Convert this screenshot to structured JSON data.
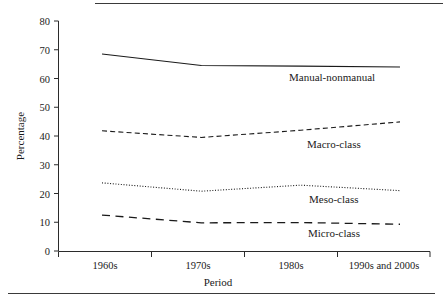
{
  "chart_data": {
    "type": "line",
    "title": "",
    "xlabel": "Period",
    "ylabel": "Percentage",
    "categories": [
      "1960s",
      "1970s",
      "1980s",
      "1990s and 2000s"
    ],
    "ylim": [
      0,
      80
    ],
    "yticks": [
      0,
      10,
      20,
      30,
      40,
      50,
      60,
      70,
      80
    ],
    "ytick_labels": [
      "0",
      "10",
      "20",
      "30",
      "40",
      "50",
      "60",
      "70",
      "80"
    ],
    "grid": false,
    "legend_position": "inline-right",
    "series": [
      {
        "name": "Manual-nonmanual",
        "values": [
          68.5,
          64.5,
          64.3,
          64.0
        ],
        "linestyle": "solid"
      },
      {
        "name": "Macro-class",
        "values": [
          41.8,
          39.5,
          42.0,
          44.9
        ],
        "linestyle": "dashed"
      },
      {
        "name": "Meso-class",
        "values": [
          23.7,
          20.8,
          22.9,
          21.0
        ],
        "linestyle": "dotted"
      },
      {
        "name": "Micro-class",
        "values": [
          12.5,
          9.8,
          9.9,
          9.3
        ],
        "linestyle": "long-dash"
      }
    ]
  },
  "axis": {
    "y_title": "Percentage",
    "x_title": "Period",
    "y_tick_0": "0",
    "y_tick_10": "10",
    "y_tick_20": "20",
    "y_tick_30": "30",
    "y_tick_40": "40",
    "y_tick_50": "50",
    "y_tick_60": "60",
    "y_tick_70": "70",
    "y_tick_80": "80",
    "x_tick_1": "1960s",
    "x_tick_2": "1970s",
    "x_tick_3": "1980s",
    "x_tick_4": "1990s and 2000s"
  },
  "labels": {
    "manual_nonmanual": "Manual-nonmanual",
    "macro_class": "Macro-class",
    "meso_class": "Meso-class",
    "micro_class": "Micro-class"
  },
  "colors": {
    "ink": "#1a1a1a",
    "axis": "#2b2b2b",
    "background": "#ffffff"
  }
}
